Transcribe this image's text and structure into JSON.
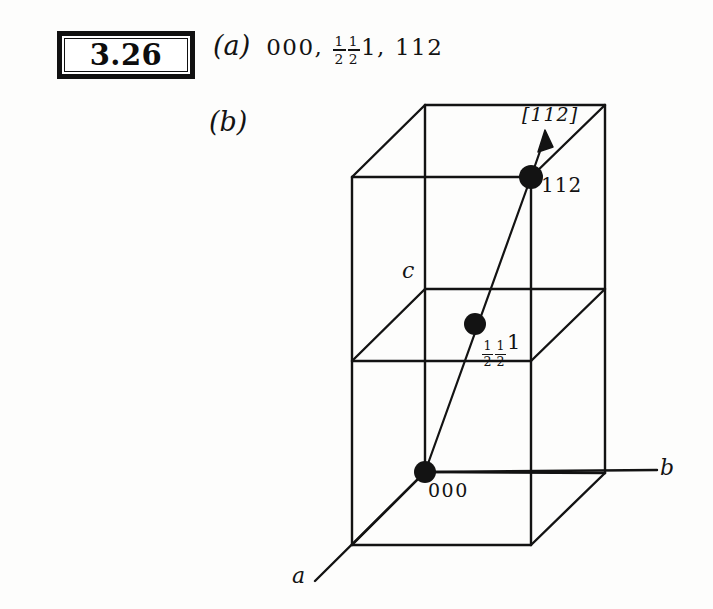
{
  "problem": {
    "number": "3.26"
  },
  "parts": {
    "a": {
      "label": "(a)",
      "answer_text": "000, ½½1, 112",
      "coordinates": [
        {
          "text": "000"
        },
        {
          "text": "½½1"
        },
        {
          "text": "112"
        }
      ],
      "separator": ","
    },
    "b": {
      "label": "(b)"
    }
  },
  "diagram": {
    "type": "crystal-unit-cell-oblique-projection",
    "cells_stacked": 2,
    "axis_labels": {
      "a": "a",
      "b": "b",
      "c": "c"
    },
    "direction_label": "[112]",
    "points": [
      {
        "name": "origin",
        "label": "000",
        "fraction": false
      },
      {
        "name": "mid",
        "label": "½½1",
        "fraction": true
      },
      {
        "name": "top",
        "label": "112",
        "fraction": false
      }
    ],
    "point_labels": {
      "origin": "000",
      "mid_num1": "1",
      "mid_den1": "2",
      "mid_num2": "1",
      "mid_den2": "2",
      "mid_tail": "1",
      "top": "112"
    }
  },
  "colors": {
    "ink": "#131313",
    "paper": "#fdfdfc",
    "box_border": "#111111"
  }
}
